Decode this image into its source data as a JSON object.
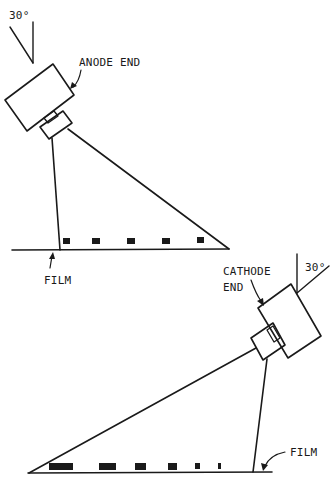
{
  "figure": {
    "top_panel": {
      "angle_label": "30°",
      "tube_end_label": "ANODE END",
      "film_label": "FILM",
      "image_marks": [
        "small",
        "small",
        "small",
        "small",
        "small"
      ]
    },
    "bottom_panel": {
      "angle_label": "30°",
      "tube_end_label_line1": "CATHODE",
      "tube_end_label_line2": "END",
      "film_label": "FILM",
      "image_marks": [
        "longest",
        "long",
        "medium",
        "medium-small",
        "small",
        "smallest"
      ]
    },
    "colors": {
      "ink": "#1a1a1a",
      "background": "#ffffff"
    }
  }
}
